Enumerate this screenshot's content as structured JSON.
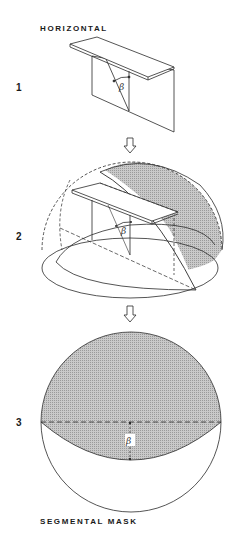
{
  "figure": {
    "steps": [
      {
        "number": "1",
        "title": "HORIZONTAL",
        "description": "horizontal overhang over vertical panel with profile angle"
      },
      {
        "number": "2",
        "description": "overhang inside hemisphere of sky, shaded segment masked"
      },
      {
        "number": "3",
        "caption": "SEGMENTAL MASK",
        "description": "plan projection circle with shaded segmental mask"
      }
    ],
    "angle_symbol": "β",
    "arrow_icon": "down-arrow",
    "colors": {
      "line": "#2a2a2a",
      "hatch": "#b8b8b8",
      "background": "#ffffff"
    }
  }
}
